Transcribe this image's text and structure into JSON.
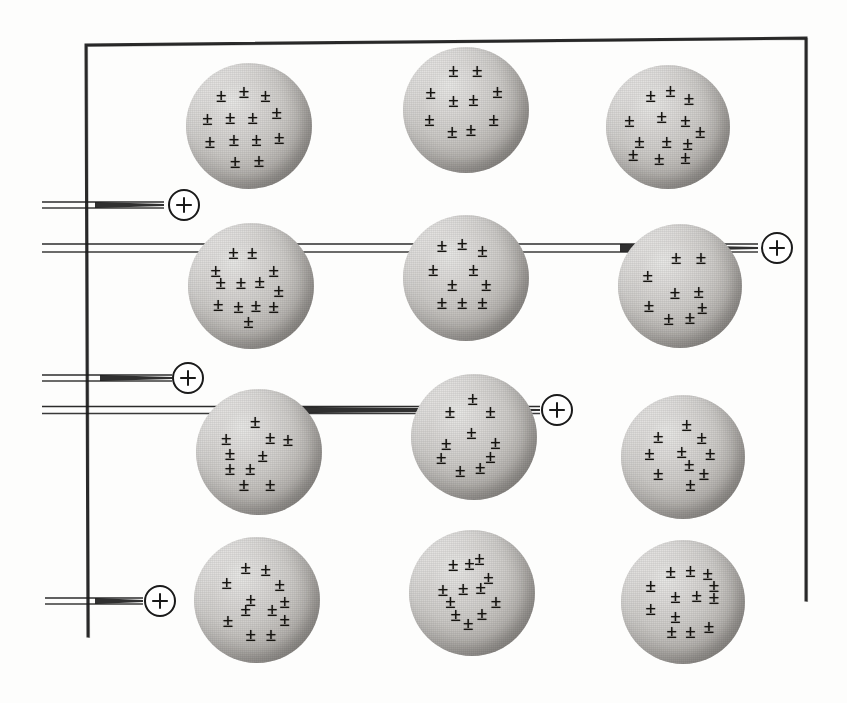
{
  "figure": {
    "background_color": "#fdfdfc",
    "width": 847,
    "height": 703,
    "ink_color": "#1a1a1a",
    "sphere_light_color": "#e9e9e7",
    "sphere_dark_color": "#8b8884"
  },
  "frame": {
    "name": "material-slab-outline",
    "stroke_color": "#1a1a1a",
    "stroke_width": 3,
    "points": [
      [
        88,
        636
      ],
      [
        86,
        45
      ],
      [
        806,
        38
      ],
      [
        806,
        600
      ]
    ]
  },
  "atoms": [
    {
      "id": "atom-r1-c1",
      "label": "atom",
      "cx": 249,
      "cy": 126,
      "r": 63,
      "charges": [
        [
          -0.44,
          -0.5
        ],
        [
          -0.08,
          -0.56
        ],
        [
          0.26,
          -0.5
        ],
        [
          -0.66,
          -0.12
        ],
        [
          -0.3,
          -0.14
        ],
        [
          0.06,
          -0.14
        ],
        [
          0.44,
          -0.22
        ],
        [
          -0.62,
          0.24
        ],
        [
          -0.24,
          0.2
        ],
        [
          0.12,
          0.2
        ],
        [
          0.48,
          0.18
        ],
        [
          -0.22,
          0.56
        ],
        [
          0.16,
          0.54
        ]
      ]
    },
    {
      "id": "atom-r1-c2",
      "label": "atom",
      "cx": 466,
      "cy": 110,
      "r": 63,
      "charges": [
        [
          -0.2,
          -0.64
        ],
        [
          0.18,
          -0.64
        ],
        [
          -0.56,
          -0.28
        ],
        [
          0.5,
          -0.3
        ],
        [
          -0.2,
          -0.16
        ],
        [
          0.12,
          -0.18
        ],
        [
          -0.58,
          0.14
        ],
        [
          0.44,
          0.14
        ],
        [
          -0.22,
          0.34
        ],
        [
          0.08,
          0.3
        ]
      ]
    },
    {
      "id": "atom-r1-c3",
      "label": "atom",
      "cx": 668,
      "cy": 127,
      "r": 62,
      "charges": [
        [
          -0.28,
          -0.52
        ],
        [
          0.04,
          -0.6
        ],
        [
          0.34,
          -0.46
        ],
        [
          -0.62,
          -0.12
        ],
        [
          -0.1,
          -0.18
        ],
        [
          0.28,
          -0.12
        ],
        [
          0.52,
          0.06
        ],
        [
          -0.46,
          0.22
        ],
        [
          -0.02,
          0.22
        ],
        [
          0.32,
          0.26
        ],
        [
          -0.56,
          0.44
        ],
        [
          -0.14,
          0.5
        ],
        [
          0.28,
          0.48
        ]
      ]
    },
    {
      "id": "atom-r2-c1",
      "label": "atom",
      "cx": 251,
      "cy": 286,
      "r": 63,
      "charges": [
        [
          -0.28,
          -0.54
        ],
        [
          0.02,
          -0.54
        ],
        [
          -0.56,
          -0.26
        ],
        [
          0.36,
          -0.26
        ],
        [
          -0.48,
          -0.06
        ],
        [
          -0.16,
          -0.06
        ],
        [
          0.14,
          -0.08
        ],
        [
          0.44,
          0.06
        ],
        [
          -0.52,
          0.28
        ],
        [
          -0.2,
          0.32
        ],
        [
          0.08,
          0.3
        ],
        [
          0.36,
          0.32
        ],
        [
          -0.04,
          0.56
        ]
      ]
    },
    {
      "id": "atom-r2-c2",
      "label": "atom",
      "cx": 466,
      "cy": 278,
      "r": 63,
      "charges": [
        [
          -0.38,
          -0.52
        ],
        [
          -0.06,
          -0.56
        ],
        [
          0.26,
          -0.44
        ],
        [
          -0.52,
          -0.14
        ],
        [
          0.12,
          -0.14
        ],
        [
          -0.22,
          0.1
        ],
        [
          0.32,
          0.1
        ],
        [
          -0.38,
          0.38
        ],
        [
          -0.06,
          0.38
        ],
        [
          0.26,
          0.38
        ]
      ]
    },
    {
      "id": "atom-r2-c3",
      "label": "atom",
      "cx": 680,
      "cy": 286,
      "r": 62,
      "charges": [
        [
          -0.06,
          -0.46
        ],
        [
          0.34,
          -0.46
        ],
        [
          -0.52,
          -0.18
        ],
        [
          -0.08,
          0.1
        ],
        [
          0.3,
          0.08
        ],
        [
          -0.5,
          0.3
        ],
        [
          0.36,
          0.34
        ],
        [
          -0.18,
          0.52
        ],
        [
          0.16,
          0.5
        ]
      ]
    },
    {
      "id": "atom-r3-c1",
      "label": "atom",
      "cx": 259,
      "cy": 452,
      "r": 63,
      "charges": [
        [
          -0.06,
          -0.5
        ],
        [
          -0.52,
          -0.22
        ],
        [
          0.18,
          -0.24
        ],
        [
          0.46,
          -0.2
        ],
        [
          -0.46,
          0.02
        ],
        [
          0.06,
          0.04
        ],
        [
          -0.46,
          0.26
        ],
        [
          -0.14,
          0.26
        ],
        [
          -0.24,
          0.5
        ],
        [
          0.18,
          0.5
        ]
      ]
    },
    {
      "id": "atom-r3-c2",
      "label": "atom",
      "cx": 474,
      "cy": 437,
      "r": 63,
      "charges": [
        [
          -0.02,
          -0.62
        ],
        [
          -0.38,
          -0.42
        ],
        [
          0.26,
          -0.42
        ],
        [
          -0.04,
          -0.08
        ],
        [
          -0.44,
          0.1
        ],
        [
          0.34,
          0.08
        ],
        [
          -0.52,
          0.32
        ],
        [
          0.26,
          0.3
        ],
        [
          -0.22,
          0.52
        ],
        [
          0.1,
          0.48
        ]
      ]
    },
    {
      "id": "atom-r3-c3",
      "label": "atom",
      "cx": 683,
      "cy": 457,
      "r": 62,
      "charges": [
        [
          0.06,
          -0.54
        ],
        [
          -0.4,
          -0.34
        ],
        [
          0.3,
          -0.32
        ],
        [
          -0.54,
          -0.06
        ],
        [
          -0.02,
          -0.1
        ],
        [
          0.44,
          -0.06
        ],
        [
          0.1,
          0.12
        ],
        [
          -0.4,
          0.26
        ],
        [
          0.34,
          0.26
        ],
        [
          0.12,
          0.44
        ]
      ]
    },
    {
      "id": "atom-r4-c1",
      "label": "atom",
      "cx": 257,
      "cy": 600,
      "r": 63,
      "charges": [
        [
          -0.18,
          -0.52
        ],
        [
          0.14,
          -0.5
        ],
        [
          -0.48,
          -0.28
        ],
        [
          0.36,
          -0.26
        ],
        [
          -0.1,
          -0.02
        ],
        [
          0.44,
          0.02
        ],
        [
          -0.18,
          0.14
        ],
        [
          0.24,
          0.14
        ],
        [
          -0.46,
          0.32
        ],
        [
          0.44,
          0.3
        ],
        [
          -0.1,
          0.54
        ],
        [
          0.22,
          0.54
        ]
      ]
    },
    {
      "id": "atom-r4-c2",
      "label": "atom",
      "cx": 472,
      "cy": 593,
      "r": 63,
      "charges": [
        [
          0.12,
          -0.56
        ],
        [
          -0.3,
          -0.46
        ],
        [
          -0.04,
          -0.48
        ],
        [
          0.26,
          -0.26
        ],
        [
          -0.46,
          -0.06
        ],
        [
          -0.14,
          -0.08
        ],
        [
          0.14,
          -0.1
        ],
        [
          -0.34,
          0.12
        ],
        [
          0.38,
          0.12
        ],
        [
          0.16,
          0.32
        ],
        [
          -0.26,
          0.34
        ],
        [
          -0.06,
          0.48
        ]
      ]
    },
    {
      "id": "atom-r4-c3",
      "label": "atom",
      "cx": 683,
      "cy": 602,
      "r": 62,
      "charges": [
        [
          -0.2,
          -0.5
        ],
        [
          0.12,
          -0.52
        ],
        [
          0.4,
          -0.46
        ],
        [
          -0.52,
          -0.28
        ],
        [
          0.5,
          -0.28
        ],
        [
          -0.12,
          -0.1
        ],
        [
          0.22,
          -0.12
        ],
        [
          0.5,
          -0.08
        ],
        [
          -0.52,
          0.1
        ],
        [
          -0.12,
          0.22
        ],
        [
          -0.18,
          0.46
        ],
        [
          0.12,
          0.46
        ],
        [
          0.42,
          0.38
        ]
      ]
    }
  ],
  "beams": [
    {
      "id": "beam-1",
      "label": "alpha-particle-track-1",
      "description": "upper beam terminating at entry marker, stopped before the atoms",
      "y": 205,
      "x_start": 42,
      "x_end": 164,
      "gap": 6,
      "stroke_width": 1.6,
      "thick_tail_from": 95
    },
    {
      "id": "beam-2",
      "label": "alpha-particle-track-2",
      "description": "undeviated beam crossing row 2, passing through three atoms and exiting right",
      "y": 248,
      "x_start": 42,
      "x_end": 758,
      "gap": 8,
      "stroke_width": 1.6,
      "thick_tail_from": 620
    },
    {
      "id": "beam-3",
      "label": "alpha-particle-track-3",
      "description": "lower beam terminating at entry marker",
      "y": 378,
      "x_start": 42,
      "x_end": 172,
      "gap": 6,
      "stroke_width": 1.6,
      "thick_tail_from": 100
    },
    {
      "id": "beam-4",
      "label": "alpha-particle-track-4",
      "description": "undeviated beam crossing row 3 through two atoms and exiting right",
      "y": 410,
      "x_start": 42,
      "x_end": 540,
      "gap": 7,
      "stroke_width": 1.6,
      "thick_tail_from": 260
    },
    {
      "id": "beam-5",
      "label": "alpha-particle-track-5",
      "description": "bottom beam terminating at entry marker",
      "y": 601,
      "x_start": 45,
      "x_end": 143,
      "gap": 6,
      "stroke_width": 1.6,
      "thick_tail_from": 95
    }
  ],
  "markers": [
    {
      "id": "marker-1",
      "label": "alpha-particle",
      "symbol": "+",
      "cx": 184,
      "cy": 205,
      "r": 15
    },
    {
      "id": "marker-2",
      "label": "alpha-particle",
      "symbol": "+",
      "cx": 777,
      "cy": 248,
      "r": 15
    },
    {
      "id": "marker-3",
      "label": "alpha-particle",
      "symbol": "+",
      "cx": 188,
      "cy": 378,
      "r": 15
    },
    {
      "id": "marker-4",
      "label": "alpha-particle",
      "symbol": "+",
      "cx": 557,
      "cy": 410,
      "r": 15
    },
    {
      "id": "marker-5",
      "label": "alpha-particle",
      "symbol": "+",
      "cx": 160,
      "cy": 601,
      "r": 15
    }
  ],
  "symbols": {
    "charge_glyph": "±",
    "particle_glyph": "+"
  },
  "chart_data": {
    "type": "diagram",
    "grid_rows": 4,
    "grid_cols": 3,
    "atom_count": 12,
    "beam_count": 5,
    "marker_count": 5,
    "charge_glyph": "±"
  }
}
